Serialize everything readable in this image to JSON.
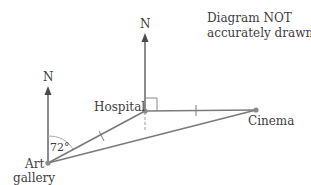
{
  "note": {
    "line1": "Diagram NOT",
    "line2": "accurately drawn"
  },
  "labels": {
    "north_art": "N",
    "north_hospital": "N",
    "hospital": "Hospital",
    "cinema": "Cinema",
    "art_line1": "Art",
    "art_line2": "gallery",
    "angle": "72°"
  },
  "colors": {
    "line": "#7a7a7a",
    "point": "#8a8a8a",
    "text": "#3d3d3d",
    "arrow": "#4a4a4a"
  }
}
